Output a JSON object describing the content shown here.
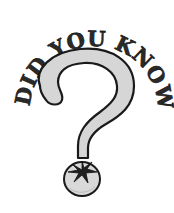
{
  "illustration": {
    "headline": "DID YOU KNOW",
    "symbol": "question-mark",
    "dot_object": "tomato",
    "colors": {
      "background": "#ffffff",
      "outline": "#1a1a1a",
      "fill_gray": "#d6d6d6",
      "text": "#2a2a2a",
      "leaf": "#1f1f1f"
    }
  }
}
